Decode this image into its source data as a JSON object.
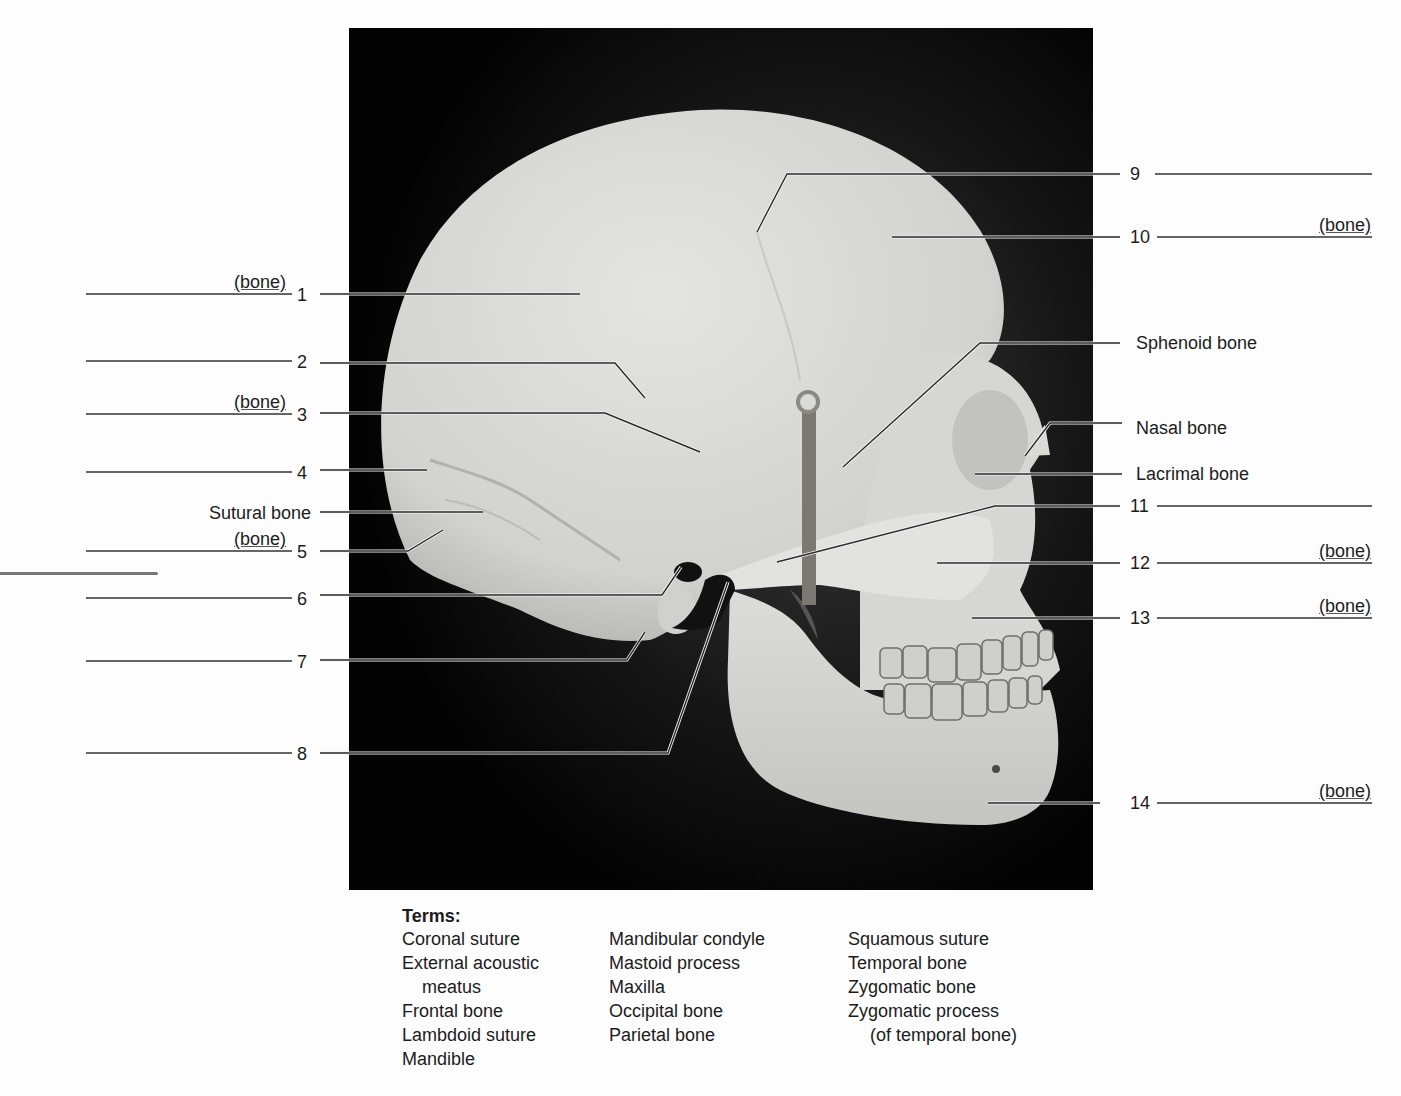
{
  "figure": {
    "photo_bg": "#050505",
    "bone_color": "#d9d9d6",
    "line_color": "#2a2a2a",
    "left_labels": [
      {
        "id": "1",
        "text": "1",
        "note": "(bone)",
        "y": 294,
        "blank": true
      },
      {
        "id": "2",
        "text": "2",
        "note": "",
        "y": 361,
        "blank": true
      },
      {
        "id": "3",
        "text": "3",
        "note": "(bone)",
        "y": 414,
        "blank": true
      },
      {
        "id": "4",
        "text": "4",
        "note": "",
        "y": 472,
        "blank": true
      },
      {
        "id": "sutural",
        "text": "Sutural bone",
        "note": "",
        "y": 513,
        "blank": false
      },
      {
        "id": "5",
        "text": "5",
        "note": "(bone)",
        "y": 551,
        "blank": true
      },
      {
        "id": "6",
        "text": "6",
        "note": "",
        "y": 598,
        "blank": true
      },
      {
        "id": "7",
        "text": "7",
        "note": "",
        "y": 661,
        "blank": true
      },
      {
        "id": "8",
        "text": "8",
        "note": "",
        "y": 753,
        "blank": true
      }
    ],
    "right_labels": [
      {
        "id": "9",
        "text": "9",
        "note": "",
        "y": 174,
        "blank": true
      },
      {
        "id": "10",
        "text": "10",
        "note": "(bone)",
        "y": 237,
        "blank": true
      },
      {
        "id": "sphenoid",
        "text": "Sphenoid bone",
        "note": "",
        "y": 343,
        "blank": false
      },
      {
        "id": "nasal",
        "text": "Nasal bone",
        "note": "",
        "y": 428,
        "blank": false
      },
      {
        "id": "lacrimal",
        "text": "Lacrimal bone",
        "note": "",
        "y": 474,
        "blank": false
      },
      {
        "id": "11",
        "text": "11",
        "note": "",
        "y": 506,
        "blank": true
      },
      {
        "id": "12",
        "text": "12",
        "note": "(bone)",
        "y": 563,
        "blank": true
      },
      {
        "id": "13",
        "text": "13",
        "note": "(bone)",
        "y": 618,
        "blank": true
      },
      {
        "id": "14",
        "text": "14",
        "note": "(bone)",
        "y": 803,
        "blank": true
      }
    ],
    "leaders": [
      {
        "for": "1",
        "points": "320,294 580,294"
      },
      {
        "for": "2",
        "points": "320,363 615,363 645,398"
      },
      {
        "for": "3",
        "points": "320,413 605,413 700,452"
      },
      {
        "for": "4",
        "points": "320,470 427,470"
      },
      {
        "for": "sutural",
        "points": "320,512 483,512"
      },
      {
        "for": "5",
        "points": "320,551 408,551 443,530"
      },
      {
        "for": "6",
        "points": "320,595 662,595 681,567"
      },
      {
        "for": "7",
        "points": "320,660 627,660 645,632"
      },
      {
        "for": "8",
        "points": "320,753 668,753 728,582"
      },
      {
        "for": "9",
        "points": "1120,174 787,174 757,232"
      },
      {
        "for": "10",
        "points": "1120,237 892,237"
      },
      {
        "for": "sphenoid",
        "points": "1120,343 980,343 843,467"
      },
      {
        "for": "nasal",
        "points": "1122,423 1050,423 1025,456"
      },
      {
        "for": "lacrimal",
        "points": "1122,474 975,474"
      },
      {
        "for": "11",
        "points": "1120,506 995,506 777,562"
      },
      {
        "for": "12",
        "points": "1120,563 937,563"
      },
      {
        "for": "13",
        "points": "1120,618 972,618"
      },
      {
        "for": "14",
        "points": "1100,803 988,803"
      }
    ]
  },
  "terms": {
    "title": "Terms:",
    "col1": [
      "Coronal suture",
      "External acoustic",
      "meatus",
      "Frontal bone",
      "Lambdoid suture",
      "Mandible"
    ],
    "col2": [
      "Mandibular condyle",
      "Mastoid process",
      "Maxilla",
      "Occipital bone",
      "Parietal bone"
    ],
    "col3": [
      "Squamous suture",
      "Temporal bone",
      "Zygomatic bone",
      "Zygomatic process",
      "(of temporal bone)"
    ]
  }
}
